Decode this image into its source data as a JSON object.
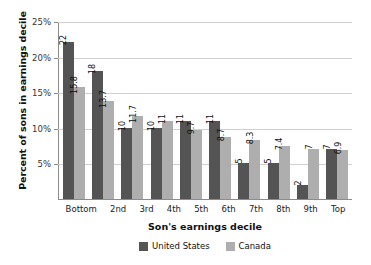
{
  "chart_data": {
    "type": "bar",
    "title": "",
    "xlabel": "Son's earnings decile",
    "ylabel": "Percent of sons in earnings decile",
    "categories": [
      "Bottom",
      "2nd",
      "3rd",
      "4th",
      "5th",
      "6th",
      "7th",
      "8th",
      "9th",
      "Top"
    ],
    "series": [
      {
        "name": "United States",
        "color": "#545454",
        "values": [
          22,
          18,
          10,
          10,
          11,
          11,
          5,
          5,
          2,
          7
        ],
        "labels": [
          "22",
          "18",
          "10",
          "10",
          "11",
          "11",
          "5",
          "5",
          "2",
          "7"
        ]
      },
      {
        "name": "Canada",
        "color": "#aeaeae",
        "values": [
          15.8,
          13.7,
          11.7,
          11,
          9.7,
          8.7,
          8.3,
          7.4,
          7,
          6.9
        ],
        "labels": [
          "15.8",
          "13.7",
          "11.7",
          "11",
          "9.7",
          "8.7",
          "8.3",
          "7.4",
          "7",
          "6.9"
        ]
      }
    ],
    "ylim": [
      0,
      25
    ],
    "yticks": [
      5,
      10,
      15,
      20,
      25
    ],
    "ytick_labels": [
      "5%",
      "10%",
      "15%",
      "20%",
      "25%"
    ],
    "grid": true,
    "legend_position": "bottom-center"
  },
  "axes": {
    "y_title": "Percent of sons in earnings decile",
    "x_title": "Son's earnings decile"
  },
  "legend": {
    "items": [
      {
        "label": "United States"
      },
      {
        "label": "Canada"
      }
    ]
  }
}
